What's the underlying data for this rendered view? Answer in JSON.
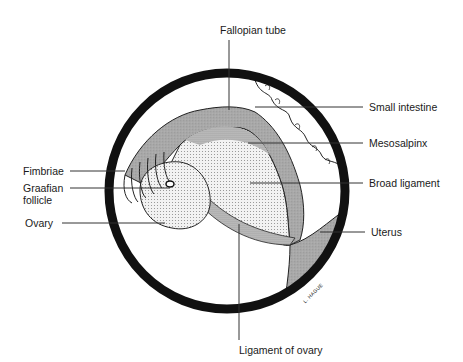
{
  "diagram": {
    "type": "anatomical illustration",
    "signature": "L. HAGUE",
    "colors": {
      "ring": "#111111",
      "tube": "#a8a8a8",
      "broad_ligament": "#e4e4e4",
      "mesosalpinx": "#cfcfcf",
      "ovary": "#dcdcdc",
      "ligament_of_ovary": "#b5b5b5",
      "uterus": "#b0b0b0",
      "leader_line": "#333333"
    }
  },
  "labels": {
    "fallopian_tube": "Fallopian tube",
    "small_intestine": "Small intestine",
    "mesosalpinx": "Mesosalpinx",
    "broad_ligament": "Broad ligament",
    "fimbriae": "Fimbriae",
    "graafian_follicle_line1": "Graafian",
    "graafian_follicle_line2": "follicle",
    "ovary": "Ovary",
    "uterus": "Uterus",
    "ligament_of_ovary": "Ligament of ovary"
  }
}
